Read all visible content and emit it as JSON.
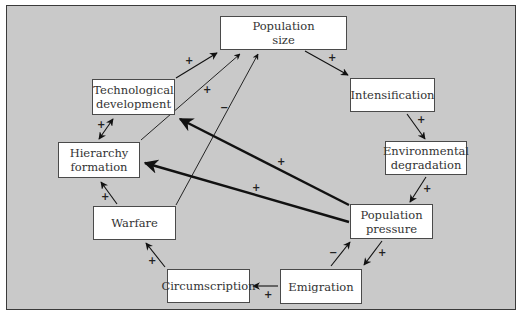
{
  "diagram": {
    "nodes": [
      {
        "id": "population_size",
        "label": "Population\nsize",
        "x": 220,
        "y": 16,
        "w": 127,
        "h": 34
      },
      {
        "id": "technological_development",
        "label": "Technological\ndevelopment",
        "x": 92,
        "y": 79,
        "w": 83,
        "h": 36
      },
      {
        "id": "intensification",
        "label": "Intensification",
        "x": 350,
        "y": 78,
        "w": 85,
        "h": 34
      },
      {
        "id": "hierarchy_formation",
        "label": "Hierarchy\nformation",
        "x": 58,
        "y": 142,
        "w": 82,
        "h": 36
      },
      {
        "id": "environmental_degradation",
        "label": "Environmental\ndegradation",
        "x": 385,
        "y": 141,
        "w": 82,
        "h": 34
      },
      {
        "id": "warfare",
        "label": "Warfare",
        "x": 93,
        "y": 206,
        "w": 83,
        "h": 34
      },
      {
        "id": "population_pressure",
        "label": "Population\npressure",
        "x": 350,
        "y": 204,
        "w": 83,
        "h": 35
      },
      {
        "id": "circumscription",
        "label": "Circumscription",
        "x": 167,
        "y": 269,
        "w": 83,
        "h": 34
      },
      {
        "id": "emigration",
        "label": "Emigration",
        "x": 280,
        "y": 269,
        "w": 82,
        "h": 35
      }
    ],
    "edges": [
      {
        "from": "technological_development",
        "to": "population_size",
        "sign": "+"
      },
      {
        "from": "hierarchy_formation",
        "to": "population_size",
        "sign": "+"
      },
      {
        "from": "warfare",
        "to": "population_size",
        "sign": "−"
      },
      {
        "from": "population_size",
        "to": "intensification",
        "sign": "+"
      },
      {
        "from": "intensification",
        "to": "environmental_degradation",
        "sign": "+"
      },
      {
        "from": "environmental_degradation",
        "to": "population_pressure",
        "sign": "+"
      },
      {
        "from": "population_pressure",
        "to": "technological_development",
        "sign": "+",
        "bold": true
      },
      {
        "from": "population_pressure",
        "to": "hierarchy_formation",
        "sign": "+",
        "bold": true
      },
      {
        "from": "population_pressure",
        "to": "emigration",
        "sign": "+"
      },
      {
        "from": "emigration",
        "to": "population_pressure",
        "sign": "−"
      },
      {
        "from": "emigration",
        "to": "circumscription",
        "sign": "+"
      },
      {
        "from": "circumscription",
        "to": "warfare",
        "sign": "+"
      },
      {
        "from": "warfare",
        "to": "hierarchy_formation",
        "sign": "+"
      },
      {
        "from": "hierarchy_formation",
        "to": "technological_development",
        "sign": "+",
        "bidirectional": true
      }
    ]
  }
}
